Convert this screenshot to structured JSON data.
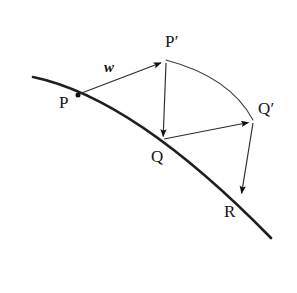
{
  "figure": {
    "background_color": "#ffffff",
    "ink_color": "#1a1a1a",
    "thin_line_color": "#3a3a3a",
    "width": 297,
    "height": 293,
    "curve": {
      "name": "main-curve",
      "description": "thick curve descending left to right passing through P, Q and R",
      "start": [
        33,
        77
      ],
      "control1": [
        105,
        92
      ],
      "control2": [
        185,
        150
      ],
      "end": [
        271,
        238
      ],
      "stroke_width": 2.6
    },
    "arc_pp_qp": {
      "name": "arc-Pprime-Qprime",
      "description": "thin curve arcing from P-prime to Q-prime",
      "start": [
        166,
        60
      ],
      "control": [
        228,
        78
      ],
      "end": [
        253,
        120
      ],
      "stroke_width": 1.1
    },
    "points": [
      {
        "id": "P",
        "label": "P",
        "x": 78,
        "y": 95,
        "dot": true
      },
      {
        "id": "Pp",
        "label": "P′",
        "x": 164,
        "y": 61,
        "dot": false
      },
      {
        "id": "Q",
        "label": "Q",
        "x": 163,
        "y": 140,
        "dot": false
      },
      {
        "id": "Qp",
        "label": "Q′",
        "x": 252,
        "y": 121,
        "dot": false
      },
      {
        "id": "R",
        "label": "R",
        "x": 241,
        "y": 197,
        "dot": false
      }
    ],
    "vectors": [
      {
        "id": "w",
        "label": "w",
        "from": "P",
        "to": "Pp",
        "x1": 79,
        "y1": 94,
        "x2": 163,
        "y2": 62
      },
      {
        "id": "pp-q",
        "label": "",
        "from": "Pp",
        "to": "Q",
        "x1": 166,
        "y1": 63,
        "x2": 163,
        "y2": 139
      },
      {
        "id": "q-qp",
        "label": "",
        "from": "Q",
        "to": "Qp",
        "x1": 164,
        "y1": 139,
        "x2": 251,
        "y2": 122
      },
      {
        "id": "qp-r",
        "label": "",
        "from": "Qp",
        "to": "R",
        "x1": 253,
        "y1": 123,
        "x2": 241,
        "y2": 196
      }
    ],
    "labels": {
      "P": "P",
      "P_prime": "P′",
      "Q": "Q",
      "Q_prime": "Q′",
      "R": "R",
      "w": "w"
    }
  }
}
